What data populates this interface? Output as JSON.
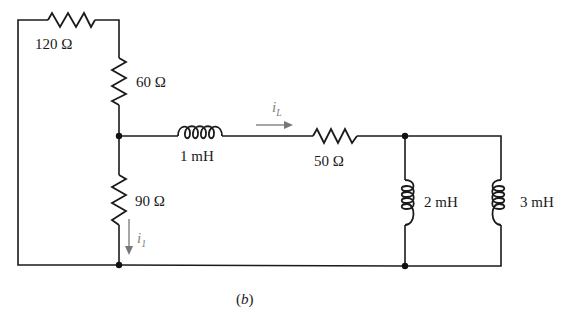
{
  "figure": {
    "caption": "(b)",
    "caption_parts": {
      "open": "(",
      "letter": "b",
      "close": ")"
    }
  },
  "components": {
    "r120": {
      "type": "resistor",
      "label": "120 Ω"
    },
    "r60": {
      "type": "resistor",
      "label": "60 Ω"
    },
    "r90": {
      "type": "resistor",
      "label": "90 Ω"
    },
    "r50": {
      "type": "resistor",
      "label": "50 Ω"
    },
    "l1": {
      "type": "inductor",
      "label": "1 mH"
    },
    "l2": {
      "type": "inductor",
      "label": "2 mH"
    },
    "l3": {
      "type": "inductor",
      "label": "3 mH"
    }
  },
  "currents": {
    "iL": {
      "symbol": "i",
      "subscript": "L",
      "direction": "right"
    },
    "i1": {
      "symbol": "i",
      "subscript": "1",
      "direction": "down"
    }
  },
  "colors": {
    "wire": "#1a1a1a",
    "current_arrow": "#777777",
    "background": "#ffffff"
  }
}
